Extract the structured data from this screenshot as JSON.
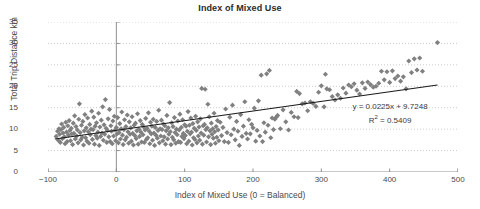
{
  "chart_data": {
    "type": "scatter",
    "title": "Index of Mixed Use",
    "xlabel": "Index of Mixed Use (0 = Balanced)",
    "ylabel": "Total Trip Distance km",
    "xlim": [
      -100,
      500
    ],
    "ylim": [
      0,
      35
    ],
    "xticks": [
      -100,
      0,
      100,
      200,
      300,
      400,
      500
    ],
    "yticks": [
      0,
      5,
      10,
      15,
      20,
      25,
      30,
      35
    ],
    "grid": "horizontal-dotted",
    "legend": "none",
    "marker": "diamond",
    "marker_color": "#808080",
    "marker_size": 4,
    "trendline": {
      "type": "linear",
      "slope": 0.0225,
      "intercept": 9.7248,
      "r_squared": 0.5409,
      "color": "#1a1a1a",
      "x_start": -90,
      "x_end": 470,
      "equation_label": "y = 0.0225x + 9.7248",
      "r2_label_prefix": "R",
      "r2_label_sup": "2",
      "r2_label_suffix": " = 0.5409"
    },
    "points": [
      [
        -88,
        8.3
      ],
      [
        -86,
        9.5
      ],
      [
        -85,
        7.4
      ],
      [
        -84,
        10.1
      ],
      [
        -83,
        8.8
      ],
      [
        -82,
        6.9
      ],
      [
        -81,
        9.9
      ],
      [
        -80,
        11.2
      ],
      [
        -79,
        7.8
      ],
      [
        -78,
        9.1
      ],
      [
        -77,
        10.4
      ],
      [
        -76,
        8.2
      ],
      [
        -75,
        6.6
      ],
      [
        -74,
        11.6
      ],
      [
        -73,
        9.3
      ],
      [
        -72,
        7.1
      ],
      [
        -71,
        10.8
      ],
      [
        -70,
        8.6
      ],
      [
        -69,
        12.0
      ],
      [
        -68,
        9.7
      ],
      [
        -67,
        7.3
      ],
      [
        -66,
        10.2
      ],
      [
        -65,
        8.9
      ],
      [
        -64,
        6.4
      ],
      [
        -63,
        11.4
      ],
      [
        -62,
        9.0
      ],
      [
        -61,
        13.1
      ],
      [
        -60,
        7.7
      ],
      [
        -59,
        10.6
      ],
      [
        -58,
        8.4
      ],
      [
        -57,
        9.8
      ],
      [
        -56,
        6.8
      ],
      [
        -55,
        12.3
      ],
      [
        -54,
        15.9
      ],
      [
        -53,
        9.2
      ],
      [
        -52,
        7.5
      ],
      [
        -51,
        10.9
      ],
      [
        -50,
        8.1
      ],
      [
        -49,
        11.8
      ],
      [
        -48,
        6.3
      ],
      [
        -47,
        9.6
      ],
      [
        -46,
        13.4
      ],
      [
        -45,
        8.0
      ],
      [
        -44,
        10.3
      ],
      [
        -43,
        7.2
      ],
      [
        -42,
        12.6
      ],
      [
        -41,
        9.4
      ],
      [
        -40,
        6.7
      ],
      [
        -39,
        11.1
      ],
      [
        -38,
        8.7
      ],
      [
        -37,
        10.0
      ],
      [
        -36,
        14.2
      ],
      [
        -35,
        7.6
      ],
      [
        -34,
        9.9
      ],
      [
        -33,
        12.8
      ],
      [
        -32,
        6.5
      ],
      [
        -31,
        10.7
      ],
      [
        -30,
        8.5
      ],
      [
        -29,
        11.5
      ],
      [
        -28,
        7.9
      ],
      [
        -27,
        9.3
      ],
      [
        -26,
        13.7
      ],
      [
        -25,
        6.2
      ],
      [
        -24,
        10.5
      ],
      [
        -23,
        8.3
      ],
      [
        -22,
        12.1
      ],
      [
        -21,
        9.1
      ],
      [
        -20,
        15.2
      ],
      [
        -19,
        7.4
      ],
      [
        -18,
        11.0
      ],
      [
        -17,
        8.8
      ],
      [
        -16,
        16.9
      ],
      [
        -15,
        10.2
      ],
      [
        -14,
        6.9
      ],
      [
        -13,
        9.7
      ],
      [
        -12,
        12.4
      ],
      [
        -11,
        8.2
      ],
      [
        -10,
        14.6
      ],
      [
        -9,
        7.1
      ],
      [
        -8,
        10.8
      ],
      [
        -7,
        9.5
      ],
      [
        -6,
        6.6
      ],
      [
        -5,
        11.9
      ],
      [
        -4,
        8.4
      ],
      [
        -3,
        13.0
      ],
      [
        -2,
        9.8
      ],
      [
        -1,
        7.3
      ],
      [
        0,
        10.4
      ],
      [
        1,
        8.9
      ],
      [
        2,
        12.7
      ],
      [
        3,
        6.8
      ],
      [
        4,
        9.2
      ],
      [
        5,
        11.3
      ],
      [
        6,
        7.7
      ],
      [
        7,
        10.1
      ],
      [
        8,
        14.0
      ],
      [
        9,
        8.6
      ],
      [
        10,
        6.4
      ],
      [
        11,
        9.9
      ],
      [
        12,
        12.2
      ],
      [
        13,
        7.5
      ],
      [
        14,
        10.6
      ],
      [
        15,
        8.1
      ],
      [
        16,
        13.3
      ],
      [
        17,
        9.4
      ],
      [
        18,
        6.7
      ],
      [
        19,
        11.7
      ],
      [
        20,
        8.8
      ],
      [
        21,
        10.3
      ],
      [
        22,
        7.2
      ],
      [
        23,
        12.9
      ],
      [
        24,
        9.0
      ],
      [
        25,
        6.3
      ],
      [
        26,
        10.9
      ],
      [
        27,
        8.5
      ],
      [
        28,
        11.4
      ],
      [
        29,
        7.8
      ],
      [
        30,
        9.6
      ],
      [
        31,
        13.6
      ],
      [
        32,
        6.5
      ],
      [
        33,
        10.0
      ],
      [
        34,
        8.3
      ],
      [
        35,
        12.0
      ],
      [
        36,
        9.3
      ],
      [
        37,
        7.0
      ],
      [
        38,
        11.1
      ],
      [
        39,
        8.7
      ],
      [
        40,
        10.5
      ],
      [
        41,
        6.9
      ],
      [
        42,
        9.8
      ],
      [
        43,
        12.5
      ],
      [
        44,
        7.6
      ],
      [
        45,
        10.2
      ],
      [
        46,
        8.0
      ],
      [
        47,
        13.8
      ],
      [
        48,
        9.5
      ],
      [
        49,
        6.6
      ],
      [
        50,
        11.6
      ],
      [
        51,
        8.9
      ],
      [
        52,
        10.7
      ],
      [
        53,
        7.4
      ],
      [
        54,
        12.3
      ],
      [
        55,
        9.1
      ],
      [
        56,
        6.2
      ],
      [
        57,
        10.4
      ],
      [
        58,
        8.6
      ],
      [
        59,
        11.8
      ],
      [
        60,
        7.9
      ],
      [
        61,
        9.7
      ],
      [
        62,
        14.4
      ],
      [
        63,
        6.8
      ],
      [
        64,
        10.1
      ],
      [
        65,
        8.4
      ],
      [
        66,
        12.1
      ],
      [
        67,
        9.9
      ],
      [
        68,
        7.3
      ],
      [
        69,
        11.2
      ],
      [
        70,
        8.2
      ],
      [
        71,
        10.8
      ],
      [
        72,
        6.5
      ],
      [
        73,
        9.6
      ],
      [
        74,
        13.2
      ],
      [
        75,
        7.7
      ],
      [
        76,
        10.3
      ],
      [
        77,
        8.8
      ],
      [
        78,
        16.2
      ],
      [
        79,
        9.4
      ],
      [
        80,
        6.4
      ],
      [
        81,
        11.5
      ],
      [
        82,
        8.1
      ],
      [
        83,
        10.6
      ],
      [
        84,
        7.5
      ],
      [
        85,
        12.7
      ],
      [
        86,
        9.2
      ],
      [
        87,
        6.7
      ],
      [
        88,
        10.0
      ],
      [
        89,
        8.7
      ],
      [
        90,
        11.9
      ],
      [
        91,
        7.1
      ],
      [
        92,
        9.8
      ],
      [
        93,
        13.5
      ],
      [
        94,
        6.9
      ],
      [
        95,
        10.4
      ],
      [
        96,
        8.3
      ],
      [
        97,
        12.2
      ],
      [
        98,
        9.0
      ],
      [
        99,
        7.8
      ],
      [
        100,
        11.0
      ],
      [
        101,
        8.5
      ],
      [
        102,
        10.7
      ],
      [
        103,
        6.6
      ],
      [
        104,
        9.5
      ],
      [
        105,
        14.1
      ],
      [
        106,
        7.2
      ],
      [
        107,
        10.9
      ],
      [
        108,
        8.9
      ],
      [
        109,
        12.6
      ],
      [
        110,
        9.3
      ],
      [
        111,
        6.3
      ],
      [
        112,
        11.3
      ],
      [
        113,
        8.0
      ],
      [
        114,
        10.2
      ],
      [
        115,
        7.6
      ],
      [
        116,
        13.0
      ],
      [
        117,
        9.7
      ],
      [
        118,
        6.8
      ],
      [
        119,
        11.7
      ],
      [
        120,
        8.4
      ],
      [
        121,
        10.5
      ],
      [
        122,
        7.4
      ],
      [
        123,
        12.4
      ],
      [
        124,
        9.1
      ],
      [
        125,
        19.5
      ],
      [
        126,
        6.5
      ],
      [
        127,
        10.8
      ],
      [
        128,
        8.6
      ],
      [
        129,
        11.1
      ],
      [
        130,
        19.3
      ],
      [
        131,
        9.9
      ],
      [
        132,
        7.0
      ],
      [
        133,
        10.3
      ],
      [
        134,
        15.8
      ],
      [
        135,
        8.2
      ],
      [
        136,
        12.9
      ],
      [
        137,
        9.6
      ],
      [
        138,
        6.4
      ],
      [
        139,
        11.4
      ],
      [
        140,
        8.8
      ],
      [
        141,
        10.1
      ],
      [
        142,
        7.9
      ],
      [
        143,
        13.7
      ],
      [
        144,
        9.4
      ],
      [
        145,
        6.7
      ],
      [
        146,
        10.6
      ],
      [
        147,
        8.1
      ],
      [
        148,
        12.0
      ],
      [
        149,
        9.8
      ],
      [
        150,
        7.3
      ],
      [
        152,
        11.6
      ],
      [
        154,
        8.5
      ],
      [
        156,
        10.4
      ],
      [
        158,
        7.1
      ],
      [
        160,
        14.7
      ],
      [
        162,
        9.2
      ],
      [
        164,
        6.9
      ],
      [
        166,
        12.8
      ],
      [
        168,
        8.7
      ],
      [
        170,
        15.6
      ],
      [
        172,
        10.0
      ],
      [
        174,
        7.5
      ],
      [
        176,
        11.8
      ],
      [
        178,
        9.5
      ],
      [
        180,
        6.2
      ],
      [
        182,
        13.4
      ],
      [
        184,
        8.3
      ],
      [
        186,
        10.7
      ],
      [
        188,
        16.4
      ],
      [
        190,
        9.0
      ],
      [
        192,
        7.7
      ],
      [
        194,
        12.2
      ],
      [
        196,
        8.9
      ],
      [
        198,
        11.1
      ],
      [
        200,
        10.3
      ],
      [
        202,
        14.9
      ],
      [
        204,
        7.2
      ],
      [
        206,
        9.7
      ],
      [
        208,
        16.6
      ],
      [
        210,
        8.4
      ],
      [
        212,
        22.6
      ],
      [
        214,
        7.1
      ],
      [
        216,
        11.5
      ],
      [
        218,
        9.3
      ],
      [
        220,
        22.9
      ],
      [
        222,
        10.9
      ],
      [
        224,
        23.7
      ],
      [
        226,
        8.0
      ],
      [
        228,
        12.6
      ],
      [
        230,
        9.9
      ],
      [
        232,
        12.3
      ],
      [
        234,
        12.8
      ],
      [
        236,
        13.2
      ],
      [
        240,
        10.1
      ],
      [
        244,
        14.5
      ],
      [
        248,
        11.7
      ],
      [
        252,
        9.8
      ],
      [
        256,
        13.9
      ],
      [
        260,
        12.9
      ],
      [
        264,
        18.8
      ],
      [
        266,
        12.7
      ],
      [
        268,
        18.3
      ],
      [
        272,
        15.9
      ],
      [
        276,
        16.1
      ],
      [
        280,
        14.3
      ],
      [
        284,
        16.4
      ],
      [
        288,
        16.0
      ],
      [
        292,
        15.3
      ],
      [
        296,
        18.6
      ],
      [
        300,
        20.1
      ],
      [
        304,
        15.2
      ],
      [
        306,
        22.8
      ],
      [
        308,
        19.4
      ],
      [
        312,
        19.2
      ],
      [
        316,
        17.6
      ],
      [
        320,
        16.8
      ],
      [
        324,
        18.0
      ],
      [
        328,
        17.2
      ],
      [
        332,
        19.6
      ],
      [
        336,
        18.4
      ],
      [
        340,
        20.3
      ],
      [
        344,
        19.9
      ],
      [
        348,
        20.6
      ],
      [
        352,
        19.1
      ],
      [
        356,
        18.2
      ],
      [
        360,
        20.8
      ],
      [
        364,
        19.5
      ],
      [
        368,
        21.0
      ],
      [
        372,
        20.4
      ],
      [
        376,
        19.8
      ],
      [
        380,
        20.0
      ],
      [
        384,
        20.7
      ],
      [
        388,
        23.5
      ],
      [
        392,
        21.5
      ],
      [
        396,
        23.4
      ],
      [
        400,
        20.9
      ],
      [
        404,
        23.6
      ],
      [
        408,
        21.8
      ],
      [
        412,
        22.4
      ],
      [
        416,
        21.2
      ],
      [
        420,
        22.2
      ],
      [
        424,
        19.4
      ],
      [
        428,
        25.9
      ],
      [
        432,
        23.2
      ],
      [
        436,
        26.4
      ],
      [
        440,
        23.8
      ],
      [
        444,
        26.6
      ],
      [
        448,
        23.5
      ],
      [
        470,
        30.2
      ]
    ]
  }
}
